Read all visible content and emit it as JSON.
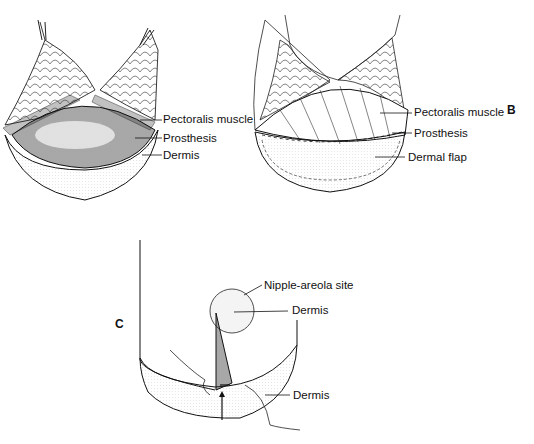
{
  "figure": {
    "panel_a": {
      "labels": [
        "Pectoralis muscle",
        "Prosthesis",
        "Dermis"
      ]
    },
    "panel_b": {
      "panel_letter": "B",
      "labels": [
        "Pectoralis muscle",
        "Prosthesis",
        "Dermal flap"
      ]
    },
    "panel_c": {
      "panel_letter": "C",
      "labels": [
        "Nipple-areola site",
        "Dermis",
        "Dermis"
      ]
    }
  }
}
